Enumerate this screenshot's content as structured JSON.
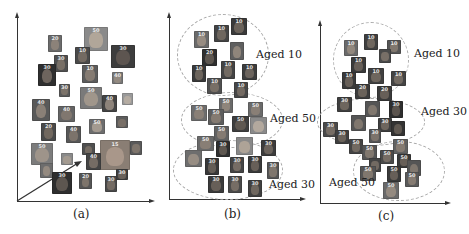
{
  "figure": {
    "panels": [
      {
        "id": "a",
        "caption": "(a)",
        "clusters": [],
        "has_arrow": true
      },
      {
        "id": "b",
        "caption": "(b)",
        "clusters": [
          {
            "label": "Aged 10"
          },
          {
            "label": "Aged 50"
          },
          {
            "label": "Aged 30"
          }
        ]
      },
      {
        "id": "c",
        "caption": "(c)",
        "clusters": [
          {
            "label": "Aged 10"
          },
          {
            "label": "Aged 30"
          },
          {
            "label": "Aged 50"
          }
        ]
      }
    ],
    "colors": {
      "axis": "#333333",
      "ellipse": "#a9a9a9",
      "text": "#222222"
    }
  }
}
